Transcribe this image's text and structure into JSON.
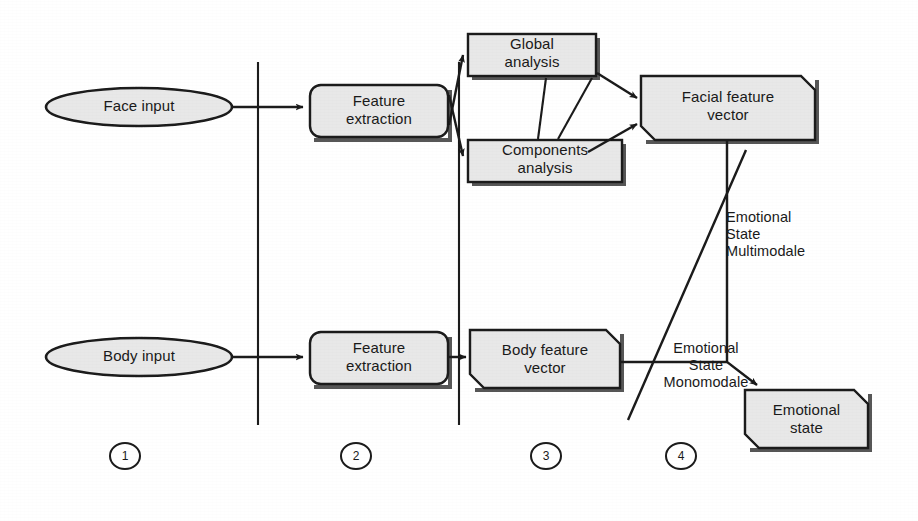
{
  "diagram": {
    "background_color": "#ffffff",
    "shape_fill": "#e8e8e8",
    "stroke_color": "#1a1a1a",
    "nodes": {
      "face_input": {
        "label": "Face input",
        "shape": "ellipse"
      },
      "body_input": {
        "label": "Body input",
        "shape": "ellipse"
      },
      "face_feature_extraction": {
        "label": "Feature\nextraction",
        "shape": "rounded-rect"
      },
      "body_feature_extraction": {
        "label": "Feature\nextraction",
        "shape": "rounded-rect"
      },
      "global_analysis": {
        "label": "Global\nanalysis",
        "shape": "rect"
      },
      "components_analysis": {
        "label": "Components\nanalysis",
        "shape": "rect"
      },
      "facial_feature_vector": {
        "label": "Facial feature\nvector",
        "shape": "cut-corner-rect"
      },
      "body_feature_vector": {
        "label": "Body feature\nvector",
        "shape": "cut-corner-rect"
      },
      "emotional_state": {
        "label": "Emotional\nstate",
        "shape": "cut-corner-rect"
      }
    },
    "edge_labels": {
      "multimodale": "Emotional\nState\nMultimodale",
      "monomodale": "Emotional\nState\nMonomodale"
    },
    "stages": [
      {
        "number": "1"
      },
      {
        "number": "2"
      },
      {
        "number": "3"
      },
      {
        "number": "4"
      }
    ]
  }
}
